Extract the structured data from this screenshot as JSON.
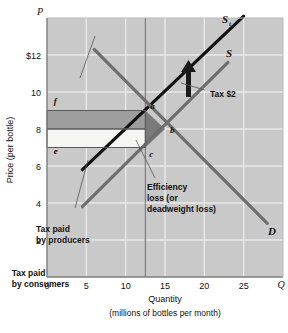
{
  "chart_data": {
    "type": "line",
    "title": "",
    "xlabel": "Quantity",
    "xsublabel": "(millions of bottles per month)",
    "ylabel": "Price (per bottle)",
    "xaxis_symbol": "Q",
    "yaxis_symbol": "P",
    "xlim": [
      0,
      30
    ],
    "ylim": [
      0,
      14
    ],
    "xticks": [
      "0",
      "5",
      "10",
      "15",
      "20",
      "25"
    ],
    "xtick_values": [
      0,
      5,
      10,
      15,
      20,
      25
    ],
    "yticks": [
      "$12",
      "10",
      "8",
      "6",
      "4",
      "2"
    ],
    "ytick_values": [
      12,
      10,
      8,
      6,
      4,
      2
    ],
    "grid": true,
    "series": [
      {
        "name": "S_t",
        "label": "S",
        "sublabel": "t",
        "description": "supply curve after tax",
        "points": [
          [
            4.5,
            5.8
          ],
          [
            25.0,
            14.1
          ]
        ],
        "color": "#111111",
        "width": 3.2
      },
      {
        "name": "S",
        "label": "S",
        "sublabel": "",
        "description": "supply curve before tax",
        "points": [
          [
            4.5,
            3.8
          ],
          [
            23.0,
            11.6
          ]
        ],
        "color": "#6e6e6e",
        "width": 3.2
      },
      {
        "name": "D",
        "label": "D",
        "sublabel": "",
        "description": "demand curve",
        "points": [
          [
            6.0,
            12.3
          ],
          [
            28.0,
            2.9
          ]
        ],
        "color": "#6e6e6e",
        "width": 3.2
      }
    ],
    "points": [
      {
        "label": "a",
        "x": 12.5,
        "y": 9.0
      },
      {
        "label": "b",
        "x": 15.0,
        "y": 8.0
      },
      {
        "label": "c",
        "x": 12.5,
        "y": 7.0
      },
      {
        "label": "f",
        "x": 0.6,
        "y": 9.35
      },
      {
        "label": "e",
        "x": 0.6,
        "y": 6.65
      }
    ],
    "regions": [
      {
        "name": "tax-paid-by-consumers",
        "x0": 0,
        "x1": 12.5,
        "y0": 8,
        "y1": 9,
        "fill": "#9e9e9e"
      },
      {
        "name": "tax-paid-by-producers",
        "x0": 0,
        "x1": 12.5,
        "y0": 7,
        "y1": 8,
        "fill": "#f5f5f2"
      },
      {
        "name": "deadweight-loss-triangle",
        "vertices": [
          [
            12.5,
            9.0
          ],
          [
            15.0,
            8.0
          ],
          [
            12.5,
            7.0
          ]
        ],
        "fill": "#7a7a7a"
      }
    ],
    "annotations": [
      {
        "name": "tax-paid-by-consumers-label",
        "lines": [
          "Tax paid",
          "by consumers"
        ],
        "x": 11.7,
        "y": 276
      },
      {
        "name": "tax-paid-by-producers-label",
        "lines": [
          "Tax paid",
          "by producers"
        ],
        "x": 36,
        "y": 232
      },
      {
        "name": "efficiency-loss-label",
        "lines": [
          "Efficiency",
          "loss (or",
          "deadweight loss)"
        ],
        "x": 147,
        "y": 190
      },
      {
        "name": "tax-amount-label",
        "lines": [
          "Tax $2"
        ],
        "x": 210,
        "y": 97
      }
    ],
    "tax_amount": "$2",
    "equilibrium_before_tax": {
      "quantity": 15,
      "price": 8
    },
    "equilibrium_after_tax": {
      "quantity": 12.5,
      "price_consumers": 9,
      "price_producers": 7
    }
  },
  "colors": {
    "plot_background": "#c9c9c9",
    "gridline": "#e8e8e8",
    "axis": "#7d7d7d",
    "supply_tax": "#111111",
    "supply": "#6e6e6e",
    "demand": "#6e6e6e",
    "consumer_region": "#9e9e9e",
    "producer_region": "#f5f5f2",
    "deadweight": "#7a7a7a",
    "text": "#111111"
  }
}
